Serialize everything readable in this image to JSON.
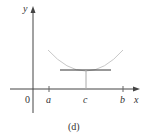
{
  "figure": {
    "caption": "(d)",
    "axes": {
      "x_label": "x",
      "y_label": "y",
      "origin_label": "0"
    },
    "ticks": [
      {
        "label": "a",
        "x": 49
      },
      {
        "label": "c",
        "x": 86
      },
      {
        "label": "b",
        "x": 123
      }
    ],
    "colors": {
      "curve": "#c8c8c8",
      "axes": "#444444",
      "tangent": "#333333"
    }
  }
}
